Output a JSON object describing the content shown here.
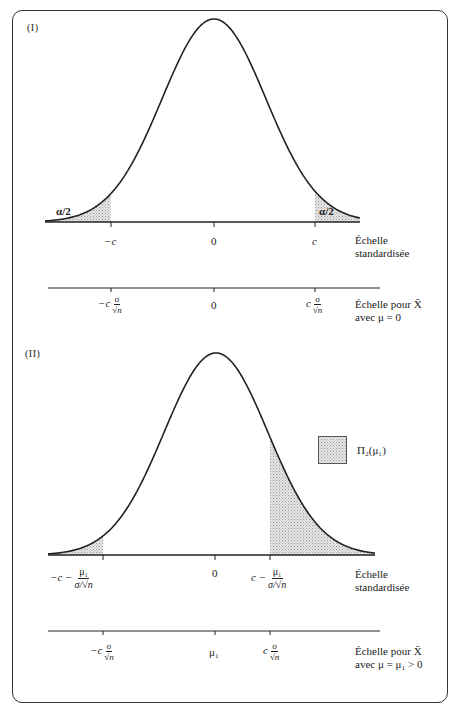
{
  "header_fragment": "· · · · · · · · · · · · · · · · · · · · · ·",
  "panel1": {
    "label": "(I)",
    "tail_label": "α/2",
    "axis_std": {
      "ticks": [
        "−c",
        "0",
        "c"
      ],
      "scale_label_1": "Échelle",
      "scale_label_2": "standardisée"
    },
    "axis_x": {
      "tick_left_prefix": "−c",
      "tick_mid": "0",
      "tick_right_prefix": "c",
      "frac_num": "σ",
      "frac_den": "√n",
      "scale_label_1": "Échelle pour X̄",
      "scale_label_2": "avec μ = 0"
    }
  },
  "panel2": {
    "label": "(II)",
    "legend_label": "Π₂(μ₁)",
    "axis_std": {
      "tick_left_prefix": "−c −",
      "tick_mid": "0",
      "tick_right_prefix": "c −",
      "frac_num": "μ₁",
      "frac_den": "σ/√n",
      "scale_label_1": "Échelle",
      "scale_label_2": "standardisée"
    },
    "axis_x": {
      "tick_left_prefix": "−c",
      "tick_mid": "μ₁",
      "tick_right_prefix": "c",
      "frac_num": "σ",
      "frac_den": "√n",
      "scale_label_1": "Échelle pour X̄",
      "scale_label_2": "avec μ = μ₁ > 0"
    }
  },
  "colors": {
    "ink": "#222222",
    "shade": "#d4d4d4",
    "frame": "#333333"
  }
}
